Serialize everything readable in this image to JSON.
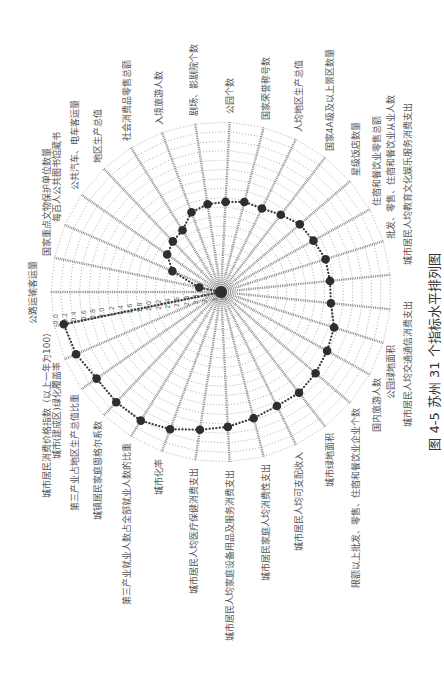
{
  "figure": {
    "caption": "图 4-5  苏州 31 个指标水平排列图"
  },
  "chart_data": {
    "type": "radar",
    "title": "",
    "series_name": "苏州",
    "radial_axis": {
      "outer_value": 0.0,
      "center_value": 3.6,
      "step": 0.2,
      "reversed": true,
      "tick_labels": [
        "0.0",
        "0.2",
        "0.4",
        "0.6",
        "0.8",
        "1.0",
        "1.2",
        "1.4",
        "1.6",
        "1.8",
        "2.0",
        "2.2",
        "2.4",
        "2.6",
        "2.8",
        "3.0",
        "3.2",
        "3.4",
        "3.6"
      ]
    },
    "grid": true,
    "legend": "none",
    "categories": [
      "公路运输客运量",
      "国家重点文物保护单位数量",
      "每百人公共图书馆藏书",
      "公共汽车、电车客运量",
      "地区生产总值",
      "社会消费品零售总额",
      "入境旅游人数",
      "剧场、影剧院个数",
      "公园个数",
      "国家荣誉称号数",
      "人均地区生产总值",
      "国家4A级及以上景区数量",
      "星级饭店数量",
      "住宿和餐饮业零售总额",
      "批发、零售、住宿和餐饮业从业人数",
      "城市居民人均教育文化娱乐服务消费支出",
      "城市居民人均交通通信消费支出",
      "公园绿地面积",
      "国内旅游人数",
      "限额以上批发、零售、住宿和餐饮业企业个数",
      "城市绿地面积",
      "城市居民人均可支配收入",
      "城市居民家庭人均消费性支出",
      "城市居民人均家庭设备用品及服务消费支出",
      "城市居民人均医疗保健消费支出",
      "城市化率",
      "第三产业就业人数占全部就业人数的比重",
      "城镇居民家庭恩格尔系数",
      "第三产业占地区生产总值比重",
      "城市(建成区)绿化覆盖率",
      "城市居民消费价格指数（以上一年为100）"
    ],
    "values": [
      3.6,
      3.13,
      2.48,
      2.21,
      2.12,
      2.06,
      1.8,
      1.72,
      1.69,
      1.63,
      1.63,
      1.53,
      1.4,
      1.36,
      1.28,
      1.28,
      1.26,
      1.09,
      1.03,
      0.96,
      0.9,
      0.91,
      0.84,
      0.74,
      0.65,
      0.5,
      0.39,
      0.38,
      0.39,
      0.26,
      0.2
    ]
  }
}
